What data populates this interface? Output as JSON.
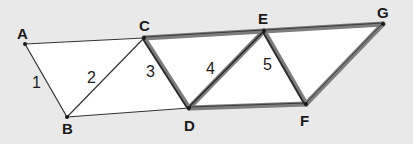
{
  "diagram": {
    "background": "#e9e9e9",
    "fill": "#ffffff",
    "thin_stroke": "#333333",
    "thick_stroke_outer": "#7d7d7d",
    "thick_stroke_inner": "#2a2a2a",
    "points": {
      "A": {
        "label": "A",
        "x": 25,
        "y": 44
      },
      "B": {
        "label": "B",
        "x": 67,
        "y": 117
      },
      "C": {
        "label": "C",
        "x": 144,
        "y": 38
      },
      "D": {
        "label": "D",
        "x": 189,
        "y": 108
      },
      "E": {
        "label": "E",
        "x": 264,
        "y": 31
      },
      "F": {
        "label": "F",
        "x": 306,
        "y": 104
      },
      "G": {
        "label": "G",
        "x": 383,
        "y": 24
      }
    },
    "segment_numbers": [
      {
        "label": "1",
        "segment": "AB"
      },
      {
        "label": "2",
        "segment": "BC"
      },
      {
        "label": "3",
        "segment": "CD"
      },
      {
        "label": "4",
        "segment": "DE"
      },
      {
        "label": "5",
        "segment": "EF"
      }
    ],
    "thin_segments": [
      "AC",
      "AB",
      "BC",
      "BD"
    ],
    "thick_segments": [
      "CE",
      "EG",
      "CD",
      "DE",
      "EF",
      "DF",
      "FG"
    ]
  }
}
